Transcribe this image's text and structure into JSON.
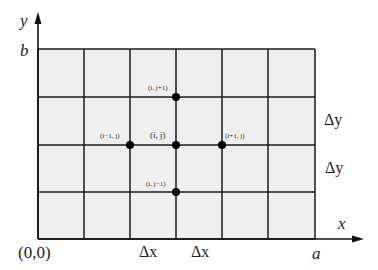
{
  "diagram": {
    "colors": {
      "fill": "#eeeeee",
      "line": "#1a1a1a",
      "axis": "#111111",
      "node": "#000000"
    },
    "grid": {
      "x_lines": [
        38,
        84,
        130,
        176,
        222,
        268,
        315
      ],
      "y_lines": [
        49,
        97,
        145,
        192,
        239
      ]
    },
    "axes": {
      "x_label": "x",
      "y_label": "y",
      "origin_label": "(0,0)",
      "x_end_label": "a",
      "y_end_label": "b"
    },
    "spacing_labels": {
      "dx_1": "Δx",
      "dx_2": "Δx",
      "dy_1": "Δy",
      "dy_2": "Δy"
    },
    "nodes": [
      {
        "id": "center",
        "label": "(i, j)",
        "x": 176,
        "y": 145
      },
      {
        "id": "top",
        "label": "(i, j+1)",
        "x": 176,
        "y": 97
      },
      {
        "id": "bottom",
        "label": "(i, j−1)",
        "x": 176,
        "y": 192
      },
      {
        "id": "left",
        "label": "(i−1, j)",
        "x": 130,
        "y": 145
      },
      {
        "id": "right",
        "label": "(i+1, j)",
        "x": 222,
        "y": 145
      }
    ]
  }
}
